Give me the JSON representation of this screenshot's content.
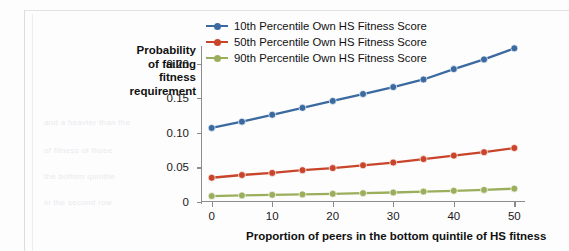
{
  "chart_data": {
    "type": "line",
    "title": "",
    "xlabel": "Proportion of peers in the bottom quintile of HS fitness",
    "ylabel": "Probability of failing fitness requirement",
    "ylabel_lines": [
      "Probability",
      "of failing",
      "fitness",
      "requirement"
    ],
    "x": [
      0,
      5,
      10,
      15,
      20,
      25,
      30,
      35,
      40,
      45,
      50
    ],
    "xticks": [
      0,
      10,
      20,
      30,
      40,
      50
    ],
    "xtick_labels": [
      "0",
      "10",
      "20",
      "30",
      "40",
      "50"
    ],
    "yticks": [
      0,
      0.05,
      0.1,
      0.15,
      0.2
    ],
    "ytick_labels": [
      "0",
      "0.05",
      "0.10",
      "0.15",
      "0.20"
    ],
    "xlim": [
      -1.6,
      51.6
    ],
    "ylim": [
      0,
      0.2167
    ],
    "grid": false,
    "legend_position": "top-center",
    "series": [
      {
        "name": "10th Percentile Own HS Fitness Score",
        "color": "#3B6AA0",
        "values": [
          0.107,
          0.116,
          0.126,
          0.136,
          0.146,
          0.156,
          0.166,
          0.177,
          0.192,
          0.206,
          0.222
        ]
      },
      {
        "name": "50th Percentile Own HS Fitness Score",
        "color": "#C8452B",
        "values": [
          0.035,
          0.039,
          0.042,
          0.046,
          0.049,
          0.053,
          0.057,
          0.062,
          0.067,
          0.072,
          0.078
        ]
      },
      {
        "name": "90th Percentile Own HS Fitness Score",
        "color": "#9BAE5C",
        "values": [
          0.0085,
          0.0095,
          0.0103,
          0.011,
          0.0118,
          0.0128,
          0.0137,
          0.015,
          0.0162,
          0.0175,
          0.0193
        ]
      }
    ]
  },
  "legend": {
    "items": [
      {
        "label": "10th Percentile Own HS Fitness Score",
        "color": "#3B6AA0"
      },
      {
        "label": "50th Percentile Own HS Fitness Score",
        "color": "#C8452B"
      },
      {
        "label": "90th Percentile Own HS Fitness Score",
        "color": "#9BAE5C"
      }
    ]
  },
  "ghost_text": {
    "lines": [
      "and a heavier than the",
      "of fitness of those",
      "the bottom quintile",
      "in the second row"
    ]
  }
}
